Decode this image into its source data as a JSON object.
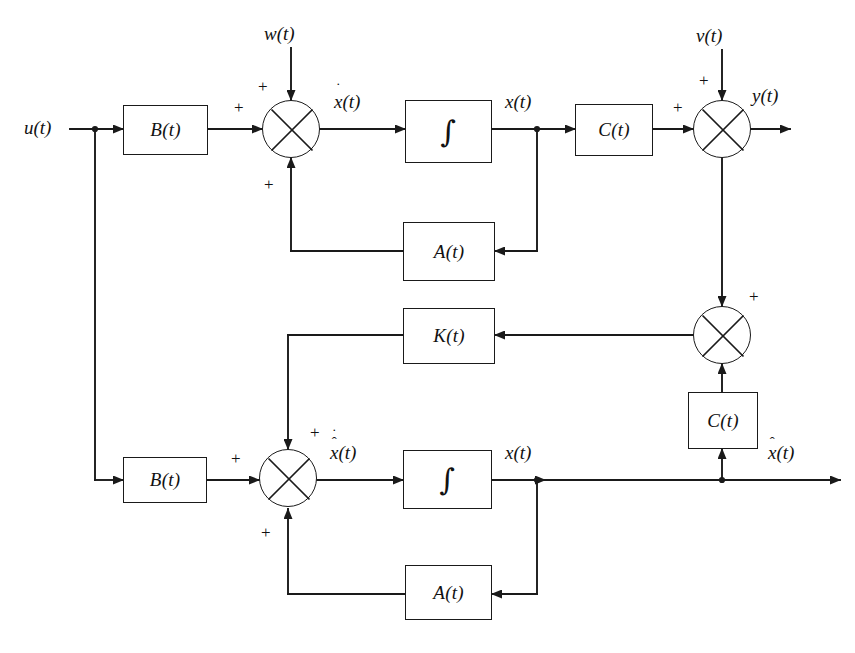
{
  "diagram": {
    "stroke_color": "#1a1a1a",
    "background_color": "#ffffff",
    "blocks": [
      {
        "id": "b-plant",
        "label": "B(t)",
        "role": "input-matrix-plant"
      },
      {
        "id": "int-plant",
        "label": "∫",
        "role": "integrator-plant"
      },
      {
        "id": "c-plant",
        "label": "C(t)",
        "role": "output-matrix-plant"
      },
      {
        "id": "a-plant",
        "label": "A(t)",
        "role": "system-matrix-plant"
      },
      {
        "id": "k-gain",
        "label": "K(t)",
        "role": "observer-gain"
      },
      {
        "id": "c-obs",
        "label": "C(t)",
        "role": "output-matrix-observer"
      },
      {
        "id": "b-obs",
        "label": "B(t)",
        "role": "input-matrix-observer"
      },
      {
        "id": "int-obs",
        "label": "∫",
        "role": "integrator-observer"
      },
      {
        "id": "a-obs",
        "label": "A(t)",
        "role": "system-matrix-observer"
      }
    ],
    "signals": {
      "u": "u(t)",
      "w": "w(t)",
      "v": "v(t)",
      "y": "y(t)",
      "xdot": {
        "base": "x",
        "arg": "(t)",
        "accent": "dot"
      },
      "x": "x(t)",
      "x_top_out": "x(t)",
      "xhatdot": {
        "base": "x",
        "arg": "(t)",
        "accent": "hat-dot"
      },
      "x_obs_out": "x(t)",
      "xhat": {
        "base": "x",
        "arg": "(t)",
        "accent": "hat"
      }
    },
    "summing_junctions": [
      {
        "id": "sum-plant",
        "signs": [
          "+",
          "+",
          "+"
        ],
        "role": "plant-state-sum"
      },
      {
        "id": "sum-output",
        "signs": [
          "+",
          "+"
        ],
        "role": "measurement-sum"
      },
      {
        "id": "sum-innov",
        "signs": [
          "+",
          "+"
        ],
        "role": "innovation-sum"
      },
      {
        "id": "sum-obs",
        "signs": [
          "+",
          "+",
          "+"
        ],
        "role": "observer-state-sum"
      }
    ],
    "sign_labels": {
      "plant_top": "+",
      "plant_left": "+",
      "plant_bottom": "+",
      "output_top": "+",
      "output_left": "+",
      "innov_top": "+",
      "obs_top": "+",
      "obs_left": "+",
      "obs_bottom": "+"
    }
  }
}
